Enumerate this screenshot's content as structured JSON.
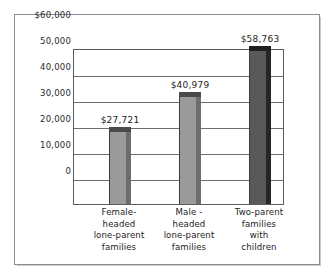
{
  "chart_data": {
    "type": "bar",
    "title": "",
    "subtitle": "",
    "xlabel": "",
    "ylabel": "",
    "ylim": [
      0,
      60000
    ],
    "grid": "horizontal",
    "legend": "none",
    "categories": [
      "Female-headed lone-parent families",
      "Male - headed lone-parent families",
      "Two-parent families with children"
    ],
    "category_lines": [
      [
        "Female-",
        "headed",
        "lone-parent",
        "families"
      ],
      [
        "Male -",
        "headed",
        "lone-parent",
        "families"
      ],
      [
        "Two-parent",
        "families",
        "with",
        "children"
      ]
    ],
    "values": [
      27721,
      40979,
      58763
    ],
    "value_labels": [
      "$27,721",
      "$40,979",
      "$58,763"
    ],
    "ytick_values": [
      60000,
      50000,
      40000,
      30000,
      20000,
      10000,
      0
    ],
    "ytick_labels": [
      "$60,000",
      "50,000",
      "40,000",
      "30,000",
      "20,000",
      "10,000",
      "0"
    ],
    "bar_colors": [
      "#9a9a9a",
      "#9a9a9a",
      "#595959"
    ],
    "bar_side_colors": [
      "#6d6d6d",
      "#6d6d6d",
      "#262626"
    ],
    "bar_top_colors": [
      "#4a4a4a",
      "#4a4a4a",
      "#1f1f1f"
    ]
  },
  "frame": {
    "border_color": "#8d8d90",
    "background": "#ffffff"
  }
}
